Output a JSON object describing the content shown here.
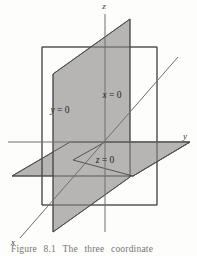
{
  "figure": {
    "number": "8.1",
    "caption_prefix": "Figure",
    "caption_text": "The three coordinate",
    "caption_full": "Figure  8.1   The three  coordinate"
  },
  "axes": [
    {
      "id": "z",
      "label": "z",
      "direction": "vertical-up",
      "label_x": 104,
      "label_y": 9
    },
    {
      "id": "y",
      "label": "y",
      "direction": "right",
      "label_x": 185,
      "label_y": 139
    },
    {
      "id": "x",
      "label": "x",
      "direction": "down-left",
      "label_x": 13,
      "label_y": 245
    }
  ],
  "planes": [
    {
      "id": "x0",
      "label": "x = 0",
      "label_var": "x",
      "label_rest": " = 0",
      "style": "outline",
      "label_x": 112,
      "label_y": 98
    },
    {
      "id": "y0",
      "label": "y = 0",
      "label_var": "y",
      "label_rest": " = 0",
      "style": "filled",
      "label_x": 60,
      "label_y": 113
    },
    {
      "id": "z0",
      "label": "z = 0",
      "label_var": "z",
      "label_rest": " = 0",
      "style": "filled",
      "label_x": 105,
      "label_y": 163
    }
  ],
  "colors": {
    "plane_fill": "#b6b5b3",
    "plane_stroke": "#4a4a4a",
    "axis_stroke": "#6e6e6e",
    "background": "#fdfdfc",
    "text": "#262626"
  }
}
